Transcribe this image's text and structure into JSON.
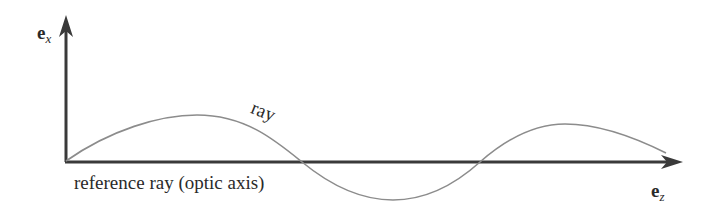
{
  "diagram": {
    "y_axis": {
      "label_main": "e",
      "label_sub": "x"
    },
    "x_axis": {
      "label_main": "e",
      "label_sub": "z"
    },
    "reference_caption": "reference ray (optic axis)",
    "ray_label": "ray",
    "colors": {
      "axis": "#3a3a3a",
      "ray": "#8c8c8c",
      "text": "#2a2a2a",
      "background": "#ffffff"
    }
  }
}
